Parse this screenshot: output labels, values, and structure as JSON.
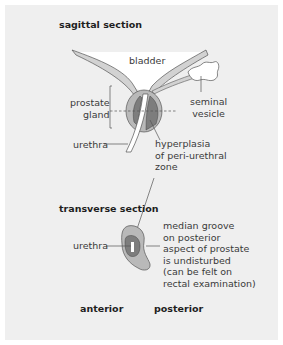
{
  "sagittal": {
    "heading": "sagittal section",
    "labels": {
      "bladder": "bladder",
      "prostate_gland": "prostate\ngland",
      "seminal_vesicle": "seminal\nvesicle",
      "urethra": "urethra",
      "hyperplasia": "hyperplasia\nof peri-urethral\nzone"
    }
  },
  "transverse": {
    "heading": "transverse section",
    "labels": {
      "urethra": "urethra",
      "median_groove": "median groove\non posterior\naspect of prostate\nis undisturbed\n(can be felt on\nrectal examination)"
    }
  },
  "orientation": {
    "anterior": "anterior",
    "posterior": "posterior"
  },
  "colors": {
    "background": "#efefef",
    "prostate_outer": "#b9b9b9",
    "hyperplasia": "#7d7d7d",
    "urethra_fill": "#ffffff",
    "outline": "#555555"
  }
}
